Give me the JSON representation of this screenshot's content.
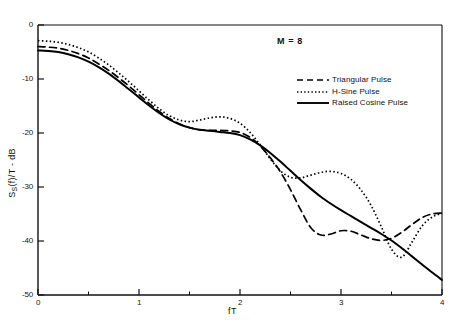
{
  "chart_data": {
    "type": "line",
    "title": "",
    "xlabel": "fT",
    "ylabel": "S_S(f)/T - dB",
    "ylabel_parts": {
      "main": "S",
      "sub": "S",
      "rest": "(f)/T - dB"
    },
    "annotation": "M = 8",
    "xlim": [
      0,
      4
    ],
    "ylim": [
      -50,
      0
    ],
    "xticks": [
      0,
      1,
      2,
      3,
      4
    ],
    "xtick_labels": [
      "0",
      "1",
      "2",
      "3",
      "4"
    ],
    "xminor_ticks": [
      0.5,
      1.5,
      2.5,
      3.5
    ],
    "yticks": [
      0,
      -10,
      -20,
      -30,
      -40,
      -50
    ],
    "ytick_labels": [
      "0",
      "-10",
      "-20",
      "-30",
      "-40",
      "-50"
    ],
    "grid": false,
    "legend_position": "upper right",
    "series": [
      {
        "name": "Triangular Pulse",
        "style": "dashed",
        "color": "#000000",
        "x": [
          0,
          0.1,
          0.2,
          0.3,
          0.4,
          0.5,
          0.6,
          0.7,
          0.8,
          0.9,
          1.0,
          1.1,
          1.2,
          1.3,
          1.4,
          1.5,
          1.6,
          1.7,
          1.8,
          1.9,
          2.0,
          2.1,
          2.2,
          2.3,
          2.4,
          2.5,
          2.6,
          2.7,
          2.8,
          2.9,
          3.0,
          3.1,
          3.2,
          3.3,
          3.4,
          3.5,
          3.6,
          3.7,
          3.8,
          3.9,
          4.0
        ],
        "y": [
          -4.0,
          -4.1,
          -4.3,
          -4.7,
          -5.3,
          -6.1,
          -7.2,
          -8.4,
          -9.8,
          -11.3,
          -12.9,
          -14.5,
          -16.0,
          -17.3,
          -18.3,
          -19.0,
          -19.4,
          -19.5,
          -19.5,
          -19.6,
          -19.9,
          -20.8,
          -22.4,
          -24.6,
          -27.2,
          -30.5,
          -34.2,
          -37.5,
          -38.9,
          -38.7,
          -38.1,
          -38.2,
          -38.9,
          -39.6,
          -39.9,
          -39.5,
          -38.4,
          -37.0,
          -35.7,
          -35.0,
          -34.8
        ]
      },
      {
        "name": "H-Sine Pulse",
        "style": "dotted",
        "color": "#000000",
        "x": [
          0,
          0.1,
          0.2,
          0.3,
          0.4,
          0.5,
          0.6,
          0.7,
          0.8,
          0.9,
          1.0,
          1.1,
          1.2,
          1.3,
          1.4,
          1.5,
          1.6,
          1.7,
          1.8,
          1.9,
          2.0,
          2.1,
          2.2,
          2.3,
          2.4,
          2.5,
          2.6,
          2.7,
          2.8,
          2.9,
          3.0,
          3.1,
          3.2,
          3.3,
          3.4,
          3.5,
          3.6,
          3.7,
          3.8,
          3.9,
          4.0
        ],
        "y": [
          -2.9,
          -3.0,
          -3.2,
          -3.6,
          -4.2,
          -5.0,
          -6.1,
          -7.4,
          -8.9,
          -10.5,
          -12.2,
          -13.9,
          -15.5,
          -16.8,
          -17.6,
          -17.9,
          -17.6,
          -17.2,
          -17.0,
          -17.3,
          -18.2,
          -19.9,
          -22.2,
          -24.8,
          -27.0,
          -28.2,
          -28.3,
          -27.8,
          -27.3,
          -27.1,
          -27.5,
          -28.6,
          -30.6,
          -33.5,
          -37.4,
          -41.5,
          -43.0,
          -40.3,
          -37.3,
          -35.6,
          -34.9
        ]
      },
      {
        "name": "Raised Cosine Pulse",
        "style": "solid",
        "color": "#000000",
        "x": [
          0,
          0.1,
          0.2,
          0.3,
          0.4,
          0.5,
          0.6,
          0.7,
          0.8,
          0.9,
          1.0,
          1.1,
          1.2,
          1.3,
          1.4,
          1.5,
          1.6,
          1.7,
          1.8,
          1.9,
          2.0,
          2.1,
          2.2,
          2.3,
          2.4,
          2.5,
          2.6,
          2.7,
          2.8,
          2.9,
          3.0,
          3.1,
          3.2,
          3.3,
          3.4,
          3.5,
          3.6,
          3.7,
          3.8,
          3.9,
          4.0
        ],
        "y": [
          -4.7,
          -4.8,
          -5.0,
          -5.4,
          -6.0,
          -6.8,
          -7.8,
          -9.0,
          -10.4,
          -11.9,
          -13.4,
          -14.9,
          -16.3,
          -17.5,
          -18.4,
          -19.0,
          -19.4,
          -19.6,
          -19.8,
          -20.0,
          -20.4,
          -21.2,
          -22.3,
          -23.7,
          -25.3,
          -27.0,
          -28.7,
          -30.3,
          -31.8,
          -33.1,
          -34.3,
          -35.4,
          -36.5,
          -37.6,
          -38.7,
          -39.9,
          -41.3,
          -42.8,
          -44.3,
          -45.8,
          -47.2
        ]
      }
    ]
  },
  "axes": {
    "x_label": "fT",
    "y_label_text": "S",
    "y_label_sub": "S",
    "y_label_rest": "(f)/T - dB"
  },
  "legend": {
    "items": [
      {
        "label": "Triangular Pulse",
        "style": "dashed"
      },
      {
        "label": "H-Sine Pulse",
        "style": "dotted"
      },
      {
        "label": "Raised Cosine Pulse",
        "style": "solid"
      }
    ]
  },
  "annotation": {
    "m_value": "M = 8"
  }
}
